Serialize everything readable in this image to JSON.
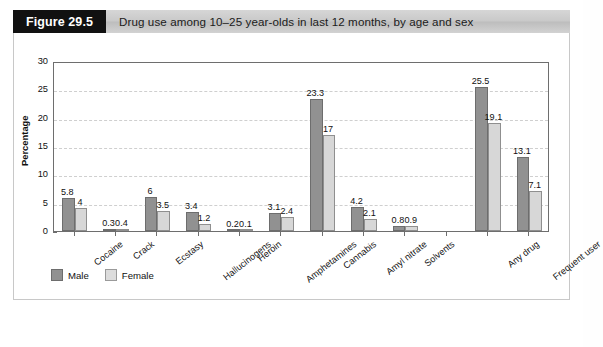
{
  "header": {
    "figure_number": "Figure 29.5",
    "title": "Drug use among 10–25 year-olds in last 12 months, by age and sex"
  },
  "legend": {
    "position": "bottom-left",
    "entries": [
      {
        "label": "Male",
        "color": "#919191"
      },
      {
        "label": "Female",
        "color": "#d7d7d7"
      }
    ]
  },
  "axis": {
    "ylabel": "Percentage",
    "yticks": [
      "0",
      "5",
      "10",
      "15",
      "20",
      "25",
      "30"
    ]
  },
  "chart_data": {
    "type": "bar",
    "title": "Drug use among 10–25 year-olds in last 12 months, by age and sex",
    "xlabel": "",
    "ylabel": "Percentage",
    "ylim": [
      0,
      30
    ],
    "ytick_step": 5,
    "grid": true,
    "legend_position": "bottom-left",
    "categories": [
      "Cocaine",
      "Crack",
      "Ecstasy",
      "Hallucinogens",
      "Heroin",
      "Amphetamines",
      "Cannabis",
      "Amyl nitrate",
      "Solvents",
      "Any drug",
      "Frequent user"
    ],
    "gap_after_category": "Solvents",
    "series": [
      {
        "name": "Male",
        "color": "#919191",
        "values": [
          5.8,
          0.3,
          6,
          3.4,
          0.2,
          3.1,
          23.3,
          4.2,
          0.8,
          25.5,
          13.1
        ]
      },
      {
        "name": "Female",
        "color": "#d7d7d7",
        "values": [
          4,
          0.4,
          3.5,
          1.2,
          0.1,
          2.4,
          17,
          2.1,
          0.9,
          19.1,
          7.1
        ]
      }
    ],
    "value_labels": {
      "Cocaine": {
        "Male": "5.8",
        "Female": "4"
      },
      "Crack": {
        "Male": "0.3",
        "Female": "0.4"
      },
      "Ecstasy": {
        "Male": "6",
        "Female": "3.5"
      },
      "Hallucinogens": {
        "Male": "3.4",
        "Female": "1.2"
      },
      "Heroin": {
        "Male": "0.2",
        "Female": "0.1"
      },
      "Amphetamines": {
        "Male": "3.1",
        "Female": "2.4"
      },
      "Cannabis": {
        "Male": "23.3",
        "Female": "17"
      },
      "Amyl nitrate": {
        "Male": "4.2",
        "Female": "2.1"
      },
      "Solvents": {
        "Male": "0.8",
        "Female": "0.9"
      },
      "Any drug": {
        "Male": "25.5",
        "Female": "19.1"
      },
      "Frequent user": {
        "Male": "13.1",
        "Female": "7.1"
      }
    }
  }
}
